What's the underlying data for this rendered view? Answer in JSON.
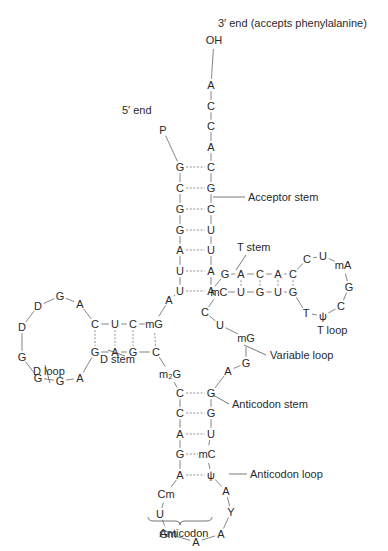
{
  "labels": [
    {
      "id": "three-prime-end",
      "text": "3′ end (accepts phenylalanine)",
      "x": 218,
      "y": 23
    },
    {
      "id": "five-prime-end",
      "text": "5′ end",
      "x": 122,
      "y": 110
    },
    {
      "id": "acceptor-stem",
      "text": "Acceptor stem",
      "x": 248,
      "y": 197
    },
    {
      "id": "t-stem",
      "text": "T stem",
      "x": 237,
      "y": 247
    },
    {
      "id": "t-loop",
      "text": "T loop",
      "x": 317,
      "y": 330
    },
    {
      "id": "d-stem",
      "text": "D stem",
      "x": 100,
      "y": 359
    },
    {
      "id": "d-loop",
      "text": "D loop",
      "x": 33,
      "y": 371
    },
    {
      "id": "variable-loop",
      "text": "Variable loop",
      "x": 270,
      "y": 355
    },
    {
      "id": "anticodon-stem",
      "text": "Anticodon stem",
      "x": 232,
      "y": 404
    },
    {
      "id": "anticodon-loop",
      "text": "Anticodon loop",
      "x": 250,
      "y": 474
    },
    {
      "id": "anticodon",
      "text": "Anticodon",
      "x": 184,
      "y": 533,
      "anchor": "middle"
    }
  ],
  "nucleotides": [
    {
      "id": "n3-OH",
      "t": "OH",
      "x": 214,
      "y": 40
    },
    {
      "id": "n3-A76",
      "t": "A",
      "x": 211,
      "y": 85
    },
    {
      "id": "n3-C75",
      "t": "C",
      "x": 211,
      "y": 106
    },
    {
      "id": "n3-C74",
      "t": "C",
      "x": 211,
      "y": 126
    },
    {
      "id": "n3-A73",
      "t": "A",
      "x": 211,
      "y": 147
    },
    {
      "id": "n5-P",
      "t": "P",
      "x": 163,
      "y": 130
    },
    {
      "id": "a1",
      "t": "G",
      "x": 180,
      "y": 167
    },
    {
      "id": "a2",
      "t": "C",
      "x": 180,
      "y": 188
    },
    {
      "id": "a3",
      "t": "G",
      "x": 180,
      "y": 209
    },
    {
      "id": "a4",
      "t": "G",
      "x": 180,
      "y": 230
    },
    {
      "id": "a5",
      "t": "A",
      "x": 180,
      "y": 250
    },
    {
      "id": "a6",
      "t": "U",
      "x": 180,
      "y": 271
    },
    {
      "id": "a7",
      "t": "U",
      "x": 180,
      "y": 291
    },
    {
      "id": "b1",
      "t": "C",
      "x": 211,
      "y": 167
    },
    {
      "id": "b2",
      "t": "G",
      "x": 211,
      "y": 188
    },
    {
      "id": "b3",
      "t": "C",
      "x": 211,
      "y": 209
    },
    {
      "id": "b4",
      "t": "U",
      "x": 211,
      "y": 230
    },
    {
      "id": "b5",
      "t": "U",
      "x": 211,
      "y": 250
    },
    {
      "id": "b6",
      "t": "A",
      "x": 211,
      "y": 271
    },
    {
      "id": "b7",
      "t": "A",
      "x": 211,
      "y": 291
    },
    {
      "id": "j8",
      "t": "A",
      "x": 169,
      "y": 300
    },
    {
      "id": "d-mG",
      "t": "mG",
      "x": 154,
      "y": 324
    },
    {
      "id": "d-C1",
      "t": "C",
      "x": 133,
      "y": 324
    },
    {
      "id": "d-U",
      "t": "U",
      "x": 115,
      "y": 324
    },
    {
      "id": "d-C2",
      "t": "C",
      "x": 95,
      "y": 324
    },
    {
      "id": "d-A1",
      "t": "A",
      "x": 80,
      "y": 304
    },
    {
      "id": "d-G1",
      "t": "G",
      "x": 60,
      "y": 296
    },
    {
      "id": "d-D1",
      "t": "D",
      "x": 38,
      "y": 306
    },
    {
      "id": "d-D2",
      "t": "D",
      "x": 22,
      "y": 327
    },
    {
      "id": "d-G2",
      "t": "G",
      "x": 22,
      "y": 357
    },
    {
      "id": "d-G3",
      "t": "G",
      "x": 38,
      "y": 378
    },
    {
      "id": "d-G4",
      "t": "G",
      "x": 60,
      "y": 381
    },
    {
      "id": "d-A2",
      "t": "A",
      "x": 80,
      "y": 378
    },
    {
      "id": "d-G5",
      "t": "G",
      "x": 95,
      "y": 352
    },
    {
      "id": "d-A3",
      "t": "A",
      "x": 115,
      "y": 352
    },
    {
      "id": "d-G6",
      "t": "G",
      "x": 133,
      "y": 352
    },
    {
      "id": "d-C3",
      "t": "C",
      "x": 156,
      "y": 352
    },
    {
      "id": "m2G",
      "t": "m₂G",
      "x": 170,
      "y": 374
    },
    {
      "id": "ac-l1",
      "t": "C",
      "x": 180,
      "y": 393
    },
    {
      "id": "ac-l2",
      "t": "C",
      "x": 180,
      "y": 413
    },
    {
      "id": "ac-l3",
      "t": "A",
      "x": 180,
      "y": 434
    },
    {
      "id": "ac-l4",
      "t": "G",
      "x": 180,
      "y": 454
    },
    {
      "id": "ac-l5",
      "t": "A",
      "x": 180,
      "y": 475
    },
    {
      "id": "ac-r1",
      "t": "G",
      "x": 211,
      "y": 393
    },
    {
      "id": "ac-r2",
      "t": "G",
      "x": 211,
      "y": 413
    },
    {
      "id": "ac-r3",
      "t": "U",
      "x": 211,
      "y": 434
    },
    {
      "id": "ac-r4",
      "t": "mC",
      "x": 207,
      "y": 454
    },
    {
      "id": "ac-r5",
      "t": "ψ",
      "x": 211,
      "y": 475
    },
    {
      "id": "acl-Cm",
      "t": "Cm",
      "x": 166,
      "y": 494
    },
    {
      "id": "acl-U",
      "t": "U",
      "x": 160,
      "y": 514
    },
    {
      "id": "acl-Gm",
      "t": "Gm",
      "x": 168,
      "y": 534
    },
    {
      "id": "acl-A1",
      "t": "A",
      "x": 196,
      "y": 542
    },
    {
      "id": "acl-A2",
      "t": "A",
      "x": 221,
      "y": 534
    },
    {
      "id": "acl-Y",
      "t": "Y",
      "x": 231,
      "y": 512
    },
    {
      "id": "acl-A3",
      "t": "A",
      "x": 226,
      "y": 491
    },
    {
      "id": "v-A",
      "t": "A",
      "x": 228,
      "y": 371
    },
    {
      "id": "v-G",
      "t": "G",
      "x": 246,
      "y": 363
    },
    {
      "id": "v-mG",
      "t": "mG",
      "x": 246,
      "y": 338
    },
    {
      "id": "v-U",
      "t": "U",
      "x": 220,
      "y": 325
    },
    {
      "id": "v-C",
      "t": "C",
      "x": 205,
      "y": 312
    },
    {
      "id": "t-mC",
      "t": "mC",
      "x": 219,
      "y": 292
    },
    {
      "id": "t-U1",
      "t": "U",
      "x": 241,
      "y": 292
    },
    {
      "id": "t-G1",
      "t": "G",
      "x": 260,
      "y": 292
    },
    {
      "id": "t-U2",
      "t": "U",
      "x": 278,
      "y": 292
    },
    {
      "id": "t-G2",
      "t": "G",
      "x": 293,
      "y": 292
    },
    {
      "id": "t-G3",
      "t": "G",
      "x": 225,
      "y": 274
    },
    {
      "id": "t-A1",
      "t": "A",
      "x": 241,
      "y": 274
    },
    {
      "id": "t-C1",
      "t": "C",
      "x": 260,
      "y": 274
    },
    {
      "id": "t-A2",
      "t": "A",
      "x": 278,
      "y": 274
    },
    {
      "id": "t-C2",
      "t": "C",
      "x": 293,
      "y": 274
    },
    {
      "id": "tl-C",
      "t": "C",
      "x": 307,
      "y": 259
    },
    {
      "id": "tl-U",
      "t": "U",
      "x": 323,
      "y": 256
    },
    {
      "id": "tl-mA",
      "t": "mA",
      "x": 343,
      "y": 265
    },
    {
      "id": "tl-G",
      "t": "G",
      "x": 349,
      "y": 287
    },
    {
      "id": "tl-C2",
      "t": "C",
      "x": 341,
      "y": 306
    },
    {
      "id": "tl-psi",
      "t": "ψ",
      "x": 323,
      "y": 316
    },
    {
      "id": "tl-T",
      "t": "T",
      "x": 306,
      "y": 313
    }
  ],
  "bonds": [
    [
      "n3-OH",
      "n3-A76"
    ],
    [
      "n3-A76",
      "n3-C75"
    ],
    [
      "n3-C75",
      "n3-C74"
    ],
    [
      "n3-C74",
      "n3-A73"
    ],
    [
      "n3-A73",
      "b1"
    ],
    [
      "n5-P",
      "a1"
    ],
    [
      "a1",
      "a2"
    ],
    [
      "a2",
      "a3"
    ],
    [
      "a3",
      "a4"
    ],
    [
      "a4",
      "a5"
    ],
    [
      "a5",
      "a6"
    ],
    [
      "a6",
      "a7"
    ],
    [
      "a7",
      "j8"
    ],
    [
      "j8",
      "d-mG"
    ],
    [
      "b1",
      "b2"
    ],
    [
      "b2",
      "b3"
    ],
    [
      "b3",
      "b4"
    ],
    [
      "b4",
      "b5"
    ],
    [
      "b5",
      "b6"
    ],
    [
      "b6",
      "b7"
    ],
    [
      "d-mG",
      "d-C1"
    ],
    [
      "d-C1",
      "d-U"
    ],
    [
      "d-U",
      "d-C2"
    ],
    [
      "d-C2",
      "d-A1"
    ],
    [
      "d-A1",
      "d-G1"
    ],
    [
      "d-G1",
      "d-D1"
    ],
    [
      "d-D1",
      "d-D2"
    ],
    [
      "d-D2",
      "d-G2"
    ],
    [
      "d-G2",
      "d-G3"
    ],
    [
      "d-G3",
      "d-G4"
    ],
    [
      "d-G4",
      "d-A2"
    ],
    [
      "d-A2",
      "d-G5"
    ],
    [
      "d-G5",
      "d-A3"
    ],
    [
      "d-A3",
      "d-G6"
    ],
    [
      "d-G6",
      "d-C3"
    ],
    [
      "d-C3",
      "m2G"
    ],
    [
      "m2G",
      "ac-l1"
    ],
    [
      "ac-l1",
      "ac-l2"
    ],
    [
      "ac-l2",
      "ac-l3"
    ],
    [
      "ac-l3",
      "ac-l4"
    ],
    [
      "ac-l4",
      "ac-l5"
    ],
    [
      "ac-l5",
      "acl-Cm"
    ],
    [
      "acl-Cm",
      "acl-U"
    ],
    [
      "acl-U",
      "acl-Gm"
    ],
    [
      "acl-Gm",
      "acl-A1"
    ],
    [
      "acl-A1",
      "acl-A2"
    ],
    [
      "acl-A2",
      "acl-Y"
    ],
    [
      "acl-Y",
      "acl-A3"
    ],
    [
      "acl-A3",
      "ac-r5"
    ],
    [
      "ac-r5",
      "ac-r4"
    ],
    [
      "ac-r4",
      "ac-r3"
    ],
    [
      "ac-r3",
      "ac-r2"
    ],
    [
      "ac-r2",
      "ac-r1"
    ],
    [
      "ac-r1",
      "v-A"
    ],
    [
      "v-A",
      "v-G"
    ],
    [
      "v-G",
      "v-mG"
    ],
    [
      "v-mG",
      "v-U"
    ],
    [
      "v-U",
      "v-C"
    ],
    [
      "v-C",
      "t-mC"
    ],
    [
      "t-mC",
      "t-U1"
    ],
    [
      "t-U1",
      "t-G1"
    ],
    [
      "t-G1",
      "t-U2"
    ],
    [
      "t-U2",
      "t-G2"
    ],
    [
      "t-G2",
      "tl-T"
    ],
    [
      "tl-T",
      "tl-psi"
    ],
    [
      "tl-psi",
      "tl-C2"
    ],
    [
      "tl-C2",
      "tl-G"
    ],
    [
      "tl-G",
      "tl-mA"
    ],
    [
      "tl-mA",
      "tl-U"
    ],
    [
      "tl-U",
      "tl-C"
    ],
    [
      "tl-C",
      "t-C2"
    ],
    [
      "t-C2",
      "t-A2"
    ],
    [
      "t-A2",
      "t-C1"
    ],
    [
      "t-C1",
      "t-A1"
    ],
    [
      "t-A1",
      "t-G3"
    ],
    [
      "t-G3",
      "b7"
    ]
  ],
  "pairs": [
    [
      "a1",
      "b1"
    ],
    [
      "a2",
      "b2"
    ],
    [
      "a3",
      "b3"
    ],
    [
      "a4",
      "b4"
    ],
    [
      "a5",
      "b5"
    ],
    [
      "a6",
      "b6"
    ],
    [
      "a7",
      "b7"
    ],
    [
      "d-C1",
      "d-G6"
    ],
    [
      "d-U",
      "d-A3"
    ],
    [
      "d-C2",
      "d-G5"
    ],
    [
      "d-mG",
      "d-C3"
    ],
    [
      "ac-l1",
      "ac-r1"
    ],
    [
      "ac-l2",
      "ac-r2"
    ],
    [
      "ac-l3",
      "ac-r3"
    ],
    [
      "ac-l4",
      "ac-r4"
    ],
    [
      "ac-l5",
      "ac-r5"
    ],
    [
      "t-U1",
      "t-A1"
    ],
    [
      "t-G1",
      "t-C1"
    ],
    [
      "t-U2",
      "t-A2"
    ],
    [
      "t-G2",
      "t-C2"
    ]
  ],
  "leaders": [
    {
      "for": "acceptor-stem",
      "points": [
        [
          213,
          197
        ],
        [
          245,
          197
        ]
      ]
    },
    {
      "for": "t-stem",
      "points": [
        [
          246,
          255
        ],
        [
          236,
          270
        ]
      ]
    },
    {
      "for": "t-loop",
      "points": []
    },
    {
      "for": "d-stem",
      "points": [
        [
          125,
          356
        ],
        [
          108,
          350
        ]
      ]
    },
    {
      "for": "d-loop",
      "points": [
        [
          50,
          383
        ],
        [
          45,
          365
        ]
      ]
    },
    {
      "for": "variable-loop",
      "points": [
        [
          244,
          345
        ],
        [
          266,
          355
        ]
      ]
    },
    {
      "for": "anticodon-stem",
      "points": [
        [
          213,
          395
        ],
        [
          229,
          404
        ]
      ]
    },
    {
      "for": "anticodon-loop",
      "points": [
        [
          229,
          474
        ],
        [
          247,
          474
        ]
      ]
    }
  ],
  "brace": {
    "x1": 148,
    "x2": 212,
    "y": 521
  }
}
